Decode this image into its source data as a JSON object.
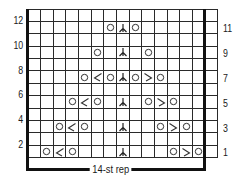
{
  "chart_data": {
    "type": "table",
    "columns": 15,
    "rows": 12,
    "repeat_label": "14-st rep",
    "repeat_columns": [
      1,
      14
    ],
    "left_row_labels": [
      "2",
      "4",
      "6",
      "8",
      "10",
      "12"
    ],
    "right_row_labels": [
      "1",
      "3",
      "5",
      "7",
      "9",
      "11"
    ],
    "symbols_legend": {
      "yo": "○",
      "k2tog": "⟋",
      "ssk": "⟍",
      "cdd": "⅄"
    },
    "stitches": [
      {
        "row": 1,
        "col": 2,
        "sym": "yo"
      },
      {
        "row": 1,
        "col": 3,
        "sym": "k2tog"
      },
      {
        "row": 1,
        "col": 4,
        "sym": "yo"
      },
      {
        "row": 1,
        "col": 8,
        "sym": "cdd"
      },
      {
        "row": 1,
        "col": 12,
        "sym": "yo"
      },
      {
        "row": 1,
        "col": 13,
        "sym": "ssk"
      },
      {
        "row": 1,
        "col": 14,
        "sym": "yo"
      },
      {
        "row": 3,
        "col": 3,
        "sym": "yo"
      },
      {
        "row": 3,
        "col": 4,
        "sym": "k2tog"
      },
      {
        "row": 3,
        "col": 5,
        "sym": "yo"
      },
      {
        "row": 3,
        "col": 8,
        "sym": "cdd"
      },
      {
        "row": 3,
        "col": 11,
        "sym": "yo"
      },
      {
        "row": 3,
        "col": 12,
        "sym": "ssk"
      },
      {
        "row": 3,
        "col": 13,
        "sym": "yo"
      },
      {
        "row": 5,
        "col": 4,
        "sym": "yo"
      },
      {
        "row": 5,
        "col": 5,
        "sym": "k2tog"
      },
      {
        "row": 5,
        "col": 6,
        "sym": "yo"
      },
      {
        "row": 5,
        "col": 8,
        "sym": "cdd"
      },
      {
        "row": 5,
        "col": 10,
        "sym": "yo"
      },
      {
        "row": 5,
        "col": 11,
        "sym": "ssk"
      },
      {
        "row": 5,
        "col": 12,
        "sym": "yo"
      },
      {
        "row": 7,
        "col": 5,
        "sym": "yo"
      },
      {
        "row": 7,
        "col": 6,
        "sym": "k2tog"
      },
      {
        "row": 7,
        "col": 7,
        "sym": "yo"
      },
      {
        "row": 7,
        "col": 8,
        "sym": "cdd"
      },
      {
        "row": 7,
        "col": 9,
        "sym": "yo"
      },
      {
        "row": 7,
        "col": 10,
        "sym": "ssk"
      },
      {
        "row": 7,
        "col": 11,
        "sym": "yo"
      },
      {
        "row": 9,
        "col": 6,
        "sym": "yo"
      },
      {
        "row": 9,
        "col": 8,
        "sym": "cdd"
      },
      {
        "row": 9,
        "col": 10,
        "sym": "yo"
      },
      {
        "row": 11,
        "col": 7,
        "sym": "yo"
      },
      {
        "row": 11,
        "col": 8,
        "sym": "cdd"
      },
      {
        "row": 11,
        "col": 9,
        "sym": "yo"
      }
    ]
  },
  "labels": {
    "repeat": "14-st rep"
  }
}
